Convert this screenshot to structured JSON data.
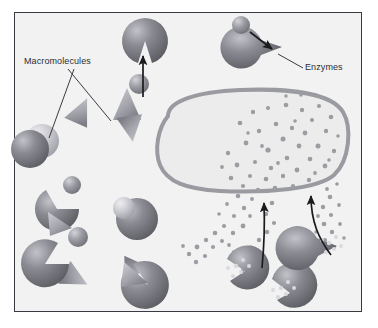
{
  "figure": {
    "background_color": "#f2f2f2",
    "frame_border_color": "#3a3a42",
    "page_background": "#ffffff"
  },
  "labels": {
    "macromolecules": "Macromolecules",
    "enzymes": "Enzymes"
  },
  "colors": {
    "sphere_dark": "#6f6f75",
    "sphere_mid": "#8e8e95",
    "sphere_light": "#c9c9cf",
    "highlight": "#e3e3e8",
    "wedge_fill": "#9a9aa1",
    "organelle_border": "#9a9aa1",
    "organelle_fill": "#ececec",
    "particle": "#9c9ca3",
    "arrow": "#1b1b1f",
    "leader_line": "#3a3a42",
    "text": "#2e2e33"
  },
  "organelle": {
    "name": "lysosome-vesicle",
    "border_width": 4,
    "outline_points": "168,115 185,100 215,93 255,90 295,91 325,97 341,112 345,135 343,160 330,178 300,188 260,191 220,190 190,186 170,176 160,158 158,135"
  },
  "legend_leaders": [
    {
      "name": "macromolecules-leader-1",
      "x1": 68,
      "y1": 68,
      "x2": 110,
      "y2": 121
    },
    {
      "name": "macromolecules-leader-2",
      "x1": 72,
      "y1": 68,
      "x2": 50,
      "y2": 137
    },
    {
      "name": "enzymes-leader",
      "x1": 303,
      "y1": 68,
      "x2": 277,
      "y2": 55
    }
  ],
  "arrows": [
    {
      "name": "substrate-entry-arrow-top",
      "d": "M 143,97 L 143,53",
      "head": "up"
    },
    {
      "name": "enzyme-binding-arrow",
      "d": "M 250,31 L 277,48",
      "head": "down-right"
    },
    {
      "name": "product-uptake-arrow-left",
      "d": "M 263,268 C 263,250 264,238 264,222 L 264,200",
      "head": "up"
    },
    {
      "name": "product-uptake-arrow-right",
      "d": "M 330,255 C 320,240 312,225 311,205 L 311,192",
      "head": "up"
    }
  ],
  "shapes": {
    "macromolecule_spheres": [
      {
        "name": "macromolecule-sphere",
        "cx": 33,
        "cy": 146,
        "r": 20,
        "tone": "dark"
      },
      {
        "name": "macromolecule-sphere",
        "cx": 139,
        "cy": 84,
        "r": 10,
        "tone": "mid"
      },
      {
        "name": "macromolecule-sphere",
        "cx": 72,
        "cy": 185,
        "r": 9,
        "tone": "mid"
      },
      {
        "name": "macromolecule-sphere",
        "cx": 78,
        "cy": 237,
        "r": 10,
        "tone": "mid"
      },
      {
        "name": "macromolecule-sphere",
        "cx": 133,
        "cy": 218,
        "r": 21,
        "tone": "dark"
      },
      {
        "name": "macromolecule-sphere",
        "cx": 160,
        "cy": 69,
        "r": 9,
        "tone": "mid"
      }
    ],
    "cut_spheres": [
      {
        "name": "cleaved-macromolecule",
        "cx": 57,
        "cy": 209,
        "r": 22,
        "wedge_start": -30,
        "wedge_end": 35
      },
      {
        "name": "cleaved-macromolecule",
        "cx": 45,
        "cy": 264,
        "r": 24,
        "wedge_start": -15,
        "wedge_end": 55
      },
      {
        "name": "cleaved-macromolecule",
        "cx": 148,
        "cy": 285,
        "r": 24,
        "wedge_start": 155,
        "wedge_end": 215
      }
    ],
    "free_wedges": [
      {
        "name": "cleaved-fragment-cone",
        "cx": 81,
        "cy": 113,
        "rot": 28
      },
      {
        "name": "cleaved-fragment-cone",
        "cx": 127,
        "cy": 103,
        "rot": 0
      },
      {
        "name": "cleaved-fragment-cone",
        "cx": 131,
        "cy": 129,
        "rot": 168
      },
      {
        "name": "cleaved-fragment-cone",
        "cx": 75,
        "cy": 278,
        "rot": 120
      },
      {
        "name": "cleaved-fragment-cone",
        "cx": 131,
        "cy": 272,
        "rot": 210
      }
    ],
    "enzymes": [
      {
        "name": "enzyme-pacman",
        "cx": 145,
        "cy": 41,
        "r": 23,
        "notch": 270
      },
      {
        "name": "enzyme-pacman",
        "cx": 282,
        "cy": 47,
        "r": 21,
        "notch": 180
      },
      {
        "name": "enzyme-pacman",
        "cx": 245,
        "cy": 271,
        "r": 22,
        "notch": 45
      },
      {
        "name": "enzyme-pacman",
        "cx": 290,
        "cy": 293,
        "r": 23,
        "notch": 110
      },
      {
        "name": "enzyme-pacman",
        "cx": 337,
        "cy": 246,
        "r": 22,
        "notch": 200
      }
    ],
    "substrate_spheres": [
      {
        "name": "substrate-sphere",
        "cx": 241,
        "cy": 25,
        "r": 9
      }
    ]
  },
  "particle_fields": [
    {
      "name": "organelle-product-particles",
      "count": 46,
      "region": "inside-organelle"
    },
    {
      "name": "digestion-product-stream-left",
      "count": 20,
      "region": "below-organelle-left"
    },
    {
      "name": "digestion-product-stream-right",
      "count": 14,
      "region": "below-organelle-right"
    }
  ]
}
